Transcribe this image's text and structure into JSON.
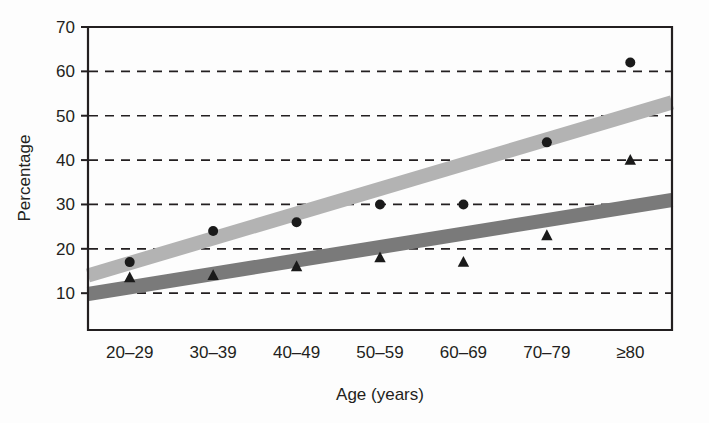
{
  "chart_data": {
    "type": "scatter",
    "title": "",
    "subtitle": "",
    "xlabel": "Age (years)",
    "ylabel": "Percentage",
    "categories": [
      "20–29",
      "30–39",
      "40–49",
      "50–59",
      "60–69",
      "70–79",
      "≥80"
    ],
    "ytick_labels": [
      "10",
      "20",
      "30",
      "40",
      "50",
      "60",
      "70"
    ],
    "ytick_values": [
      10,
      20,
      30,
      40,
      50,
      60,
      70
    ],
    "ylim": [
      0,
      70
    ],
    "xlim_categories": 7,
    "grid": "horizontal-dashed",
    "legend": "none",
    "series": [
      {
        "name": "circle-series",
        "marker": "circle",
        "marker_color": "#1a1a1a",
        "values": [
          17,
          24,
          26,
          30,
          30,
          44,
          62
        ],
        "trendline": {
          "color": "#b3b3b3",
          "start_value": 14,
          "end_value": 53,
          "width_units": 3.2
        }
      },
      {
        "name": "triangle-series",
        "marker": "triangle",
        "marker_color": "#1a1a1a",
        "values": [
          13.5,
          14,
          16,
          18,
          17,
          23,
          40
        ],
        "trendline": {
          "color": "#7a7a7a",
          "start_value": 9.8,
          "end_value": 31,
          "width_units": 3.2
        }
      }
    ],
    "colors": {
      "axis": "#231f20",
      "grid": "#231f20",
      "background": "#fdfdfd",
      "light_band": "#b3b3b3",
      "dark_band": "#7a7a7a",
      "marker": "#1a1a1a"
    },
    "geometry": {
      "plot_left": 88,
      "plot_right": 672,
      "plot_top": 27,
      "plot_bottom": 330,
      "value_top": 70,
      "value_bottom": 1.7
    }
  }
}
